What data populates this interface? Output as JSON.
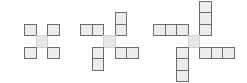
{
  "diagram": {
    "type": "pinwheel-square-pattern",
    "cell_size": 11.5,
    "colors": {
      "cell_fill": "#ededed",
      "cell_border": "#6e6e6e",
      "center_fill": "#e6e6e6"
    },
    "figures": [
      {
        "name": "figure-1",
        "arm_length": 1,
        "cells": [
          {
            "x": 24,
            "y": 23.5,
            "role": "arm-top-left"
          },
          {
            "x": 35.5,
            "y": 35,
            "role": "center"
          },
          {
            "x": 47,
            "y": 23.5,
            "role": "arm-top-right"
          },
          {
            "x": 24,
            "y": 46.5,
            "role": "arm-bottom-left"
          },
          {
            "x": 47,
            "y": 46.5,
            "role": "arm-bottom-right"
          }
        ]
      },
      {
        "name": "figure-2",
        "arm_length": 2,
        "cells": [
          {
            "x": 80,
            "y": 23.5,
            "role": "arm-left"
          },
          {
            "x": 91.5,
            "y": 23.5,
            "role": "arm-left"
          },
          {
            "x": 114.5,
            "y": 12,
            "role": "arm-top"
          },
          {
            "x": 114.5,
            "y": 23.5,
            "role": "arm-top"
          },
          {
            "x": 103,
            "y": 35,
            "role": "center"
          },
          {
            "x": 114.5,
            "y": 46.5,
            "role": "arm-right"
          },
          {
            "x": 126,
            "y": 46.5,
            "role": "arm-right"
          },
          {
            "x": 91.5,
            "y": 46.5,
            "role": "arm-bottom"
          },
          {
            "x": 91.5,
            "y": 58,
            "role": "arm-bottom"
          }
        ]
      },
      {
        "name": "figure-3",
        "arm_length": 3,
        "cells": [
          {
            "x": 153,
            "y": 23.5,
            "role": "arm-left"
          },
          {
            "x": 164.5,
            "y": 23.5,
            "role": "arm-left"
          },
          {
            "x": 176,
            "y": 23.5,
            "role": "arm-left"
          },
          {
            "x": 199,
            "y": 1,
            "role": "arm-top"
          },
          {
            "x": 199,
            "y": 12,
            "role": "arm-top"
          },
          {
            "x": 199,
            "y": 23.5,
            "role": "arm-top"
          },
          {
            "x": 187.5,
            "y": 35,
            "role": "center"
          },
          {
            "x": 199,
            "y": 46.5,
            "role": "arm-right"
          },
          {
            "x": 210.5,
            "y": 46.5,
            "role": "arm-right"
          },
          {
            "x": 222,
            "y": 46.5,
            "role": "arm-right"
          },
          {
            "x": 176,
            "y": 46.5,
            "role": "arm-bottom"
          },
          {
            "x": 176,
            "y": 58,
            "role": "arm-bottom"
          },
          {
            "x": 176,
            "y": 69.5,
            "role": "arm-bottom"
          }
        ]
      }
    ]
  }
}
